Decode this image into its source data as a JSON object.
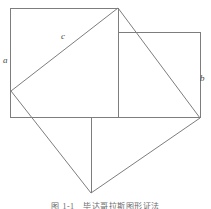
{
  "figure": {
    "caption": "图 1-1　毕达哥拉斯图形证法",
    "stroke_color": "#7d7d7d",
    "background_color": "#ffffff",
    "label_color": "#4a4a4a",
    "stroke_width": 1
  },
  "labels": {
    "a": "a",
    "b": "b",
    "c": "c"
  },
  "geometry": {
    "square_a": {
      "name": "square-a",
      "points": "10,8 118,8 118,117 10,117",
      "side_label": "a"
    },
    "square_b": {
      "name": "square-b",
      "points": "118,32 200,32 200,117 118,117",
      "side_label": "b"
    },
    "square_c": {
      "name": "square-c-tilted",
      "points": "118,8 200,118 91,193 11,91",
      "side_label": "c"
    },
    "inner_vertical_divider": {
      "name": "vertical-divider-line",
      "x1": 118,
      "y1": 8,
      "x2": 118,
      "y2": 117
    },
    "bottom_vertical_line": {
      "name": "bottom-vertical-line",
      "x1": 91,
      "y1": 117,
      "x2": 91,
      "y2": 193
    },
    "vertices": {
      "top_apex": "118,8",
      "left_vertex": "11,91",
      "right_vertex": "200,118",
      "bottom_vertex": "91,193"
    }
  }
}
